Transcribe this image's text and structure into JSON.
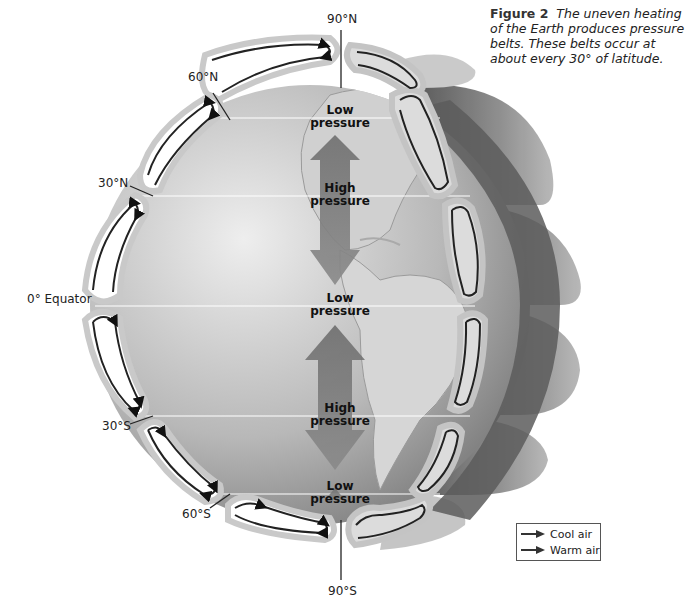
{
  "caption": {
    "figure_label": "Figure 2",
    "text": "The uneven heating of the Earth produces pressure belts. These belts occur at about every 30° of latitude."
  },
  "latitudes": {
    "n90": "90°N",
    "n60": "60°N",
    "n30": "30°N",
    "equator": "0° Equator",
    "s30": "30°S",
    "s60": "60°S",
    "s90": "90°S"
  },
  "pressure_zones": [
    {
      "line1": "Low",
      "line2": "pressure",
      "latitude": "60°N"
    },
    {
      "line1": "High",
      "line2": "pressure",
      "latitude": "30°N"
    },
    {
      "line1": "Low",
      "line2": "pressure",
      "latitude": "0°"
    },
    {
      "line1": "High",
      "line2": "pressure",
      "latitude": "30°S"
    },
    {
      "line1": "Low",
      "line2": "pressure",
      "latitude": "60°S"
    }
  ],
  "legend": {
    "items": [
      {
        "label": "Cool air",
        "color": "#3a3a3a"
      },
      {
        "label": "Warm air",
        "color": "#3a3a3a"
      }
    ]
  },
  "colors": {
    "globe_light": "#e6e6e6",
    "globe_dark": "#6e6e6e",
    "cell_fill": "#ffffff",
    "cell_border": "#c9c9c9",
    "arrow_band": "#7d7d7d",
    "shadow_band": "#5a5a5a"
  }
}
